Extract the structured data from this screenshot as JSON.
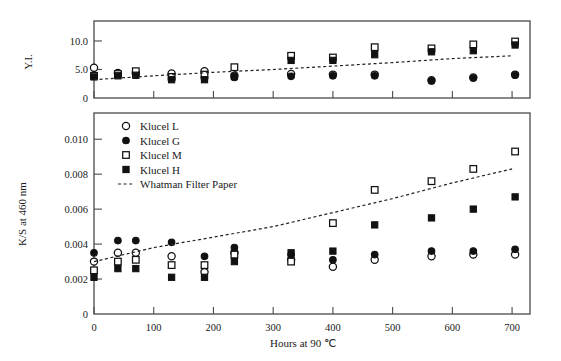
{
  "figure": {
    "xlabel": "Hours at 90 °C",
    "xlabel_parts": {
      "a": "Hours",
      "b": "at",
      "c": "90",
      "d": "℃"
    },
    "x_ticks": [
      0,
      100,
      200,
      300,
      400,
      500,
      600,
      700
    ],
    "x_tick_labels": [
      "0",
      "100",
      "200",
      "300",
      "400",
      "500",
      "600",
      "700"
    ],
    "xlim": [
      0,
      730
    ]
  },
  "legend": {
    "position": "inside-upper-left-of-lower-panel",
    "items": [
      {
        "label": "Klucel  L",
        "marker": "open-circle"
      },
      {
        "label": "Klucel  G",
        "marker": "filled-circle"
      },
      {
        "label": "Klucel  M",
        "marker": "open-square"
      },
      {
        "label": "Klucel  H",
        "marker": "filled-square"
      },
      {
        "label": "Whatman  Filter  Paper",
        "marker": "dashed-line"
      }
    ]
  },
  "chart_data": [
    {
      "type": "scatter",
      "panel": "upper",
      "title": "",
      "xlabel": "",
      "ylabel": "Y.I.",
      "ylim": [
        0,
        13.5
      ],
      "y_ticks": [
        0,
        5.0,
        10.0
      ],
      "y_tick_labels": [
        "0",
        "5.0",
        "10.0"
      ],
      "grid": false,
      "series": [
        {
          "name": "Klucel  L",
          "marker": "open-circle",
          "x": [
            0,
            40,
            70,
            130,
            185,
            235,
            330,
            400,
            470,
            565,
            635,
            705
          ],
          "y": [
            5.3,
            4.4,
            4.4,
            4.3,
            4.7,
            3.9,
            4.2,
            4.1,
            4.1,
            3.1,
            3.6,
            4.1
          ]
        },
        {
          "name": "Klucel  G",
          "marker": "filled-circle",
          "x": [
            0,
            40,
            70,
            130,
            185,
            235,
            330,
            400,
            470,
            565,
            635,
            705
          ],
          "y": [
            4.0,
            4.0,
            4.0,
            3.4,
            3.5,
            3.6,
            3.8,
            3.9,
            3.9,
            3.0,
            3.5,
            4.0
          ]
        },
        {
          "name": "Klucel  M",
          "marker": "open-square",
          "x": [
            0,
            40,
            70,
            130,
            185,
            235,
            330,
            400,
            470,
            565,
            635,
            705
          ],
          "y": [
            3.9,
            4.2,
            4.7,
            3.7,
            4.1,
            5.4,
            7.4,
            7.1,
            8.9,
            8.7,
            9.4,
            9.9
          ]
        },
        {
          "name": "Klucel  H",
          "marker": "filled-square",
          "x": [
            0,
            40,
            70,
            130,
            185,
            235,
            330,
            400,
            470,
            565,
            635,
            705
          ],
          "y": [
            3.7,
            3.9,
            4.0,
            3.2,
            3.2,
            3.8,
            6.6,
            6.6,
            7.6,
            8.1,
            8.3,
            9.3
          ]
        },
        {
          "name": "Whatman  Filter  Paper",
          "marker": "dashed-line",
          "x": [
            0,
            100,
            200,
            300,
            400,
            500,
            600,
            700
          ],
          "y": [
            3.2,
            3.9,
            4.5,
            5.0,
            5.6,
            6.2,
            6.9,
            7.4
          ]
        }
      ]
    },
    {
      "type": "scatter",
      "panel": "lower",
      "title": "",
      "xlabel": "Hours at 90 °C",
      "ylabel": "K/S at 460 nm",
      "ylim": [
        0,
        0.0115
      ],
      "y_ticks": [
        0,
        0.002,
        0.004,
        0.006,
        0.008,
        0.01
      ],
      "y_tick_labels": [
        "0",
        "0.002",
        "0.004",
        "0.006",
        "0.008",
        "0.010"
      ],
      "grid": false,
      "series": [
        {
          "name": "Klucel  L",
          "marker": "open-circle",
          "x": [
            0,
            40,
            70,
            130,
            185,
            235,
            330,
            400,
            470,
            565,
            635,
            705
          ],
          "y": [
            0.003,
            0.0035,
            0.0035,
            0.0033,
            0.0024,
            0.0035,
            0.0031,
            0.0027,
            0.0031,
            0.0033,
            0.0034,
            0.0034
          ]
        },
        {
          "name": "Klucel  G",
          "marker": "filled-circle",
          "x": [
            0,
            40,
            70,
            130,
            185,
            235,
            330,
            400,
            470,
            565,
            635,
            705
          ],
          "y": [
            0.0035,
            0.0042,
            0.0042,
            0.0041,
            0.0033,
            0.0038,
            0.0034,
            0.0031,
            0.0034,
            0.0036,
            0.0036,
            0.0037
          ]
        },
        {
          "name": "Klucel  M",
          "marker": "open-square",
          "x": [
            0,
            40,
            70,
            130,
            185,
            235,
            330,
            400,
            470,
            565,
            635,
            705
          ],
          "y": [
            0.0025,
            0.003,
            0.0031,
            0.0028,
            0.0028,
            0.0034,
            0.003,
            0.0052,
            0.0071,
            0.0076,
            0.0083,
            0.0093
          ]
        },
        {
          "name": "Klucel  H",
          "marker": "filled-square",
          "x": [
            0,
            40,
            70,
            130,
            185,
            235,
            330,
            400,
            470,
            565,
            635,
            705
          ],
          "y": [
            0.0021,
            0.0026,
            0.0026,
            0.0021,
            0.0021,
            0.003,
            0.0035,
            0.0036,
            0.0051,
            0.0055,
            0.006,
            0.0067
          ]
        },
        {
          "name": "Whatman  Filter  Paper",
          "marker": "dashed-line",
          "x": [
            0,
            100,
            200,
            300,
            400,
            500,
            600,
            700
          ],
          "y": [
            0.003,
            0.0038,
            0.0044,
            0.005,
            0.0058,
            0.0066,
            0.0075,
            0.0083
          ]
        }
      ]
    }
  ]
}
